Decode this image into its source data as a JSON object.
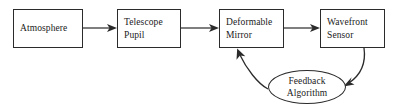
{
  "diagram": {
    "background_color": "#ffffff",
    "stroke_color": "#2b2b2b",
    "text_color": "#1a1a1a",
    "nodes": [
      {
        "id": "atmosphere",
        "shape": "rectangle",
        "lines": [
          "Atmosphere"
        ],
        "line1": "Atmosphere",
        "line2": ""
      },
      {
        "id": "telescope-pupil",
        "shape": "rectangle",
        "lines": [
          "Telescope",
          "Pupil"
        ],
        "line1": "Telescope",
        "line2": "Pupil"
      },
      {
        "id": "deformable-mirror",
        "shape": "rectangle",
        "lines": [
          "Deformable",
          "Mirror"
        ],
        "line1": "Deformable",
        "line2": "Mirror"
      },
      {
        "id": "wavefront-sensor",
        "shape": "rectangle",
        "lines": [
          "Wavefront",
          "Sensor"
        ],
        "line1": "Wavefront",
        "line2": "Sensor"
      },
      {
        "id": "feedback-algorithm",
        "shape": "ellipse",
        "lines": [
          "Feedback",
          "Algorithm"
        ],
        "line1": "Feedback",
        "line2": "Algorithm"
      }
    ],
    "connectors": [
      {
        "id": "atmosphere-to-telescope-pupil",
        "from": "atmosphere",
        "to": "telescope-pupil",
        "style": "straight",
        "direction": "right",
        "label": ""
      },
      {
        "id": "telescope-pupil-to-deformable-mirror",
        "from": "telescope-pupil",
        "to": "deformable-mirror",
        "style": "straight",
        "direction": "right",
        "label": ""
      },
      {
        "id": "deformable-mirror-to-wavefront-sensor",
        "from": "deformable-mirror",
        "to": "wavefront-sensor",
        "style": "straight",
        "direction": "right",
        "label": ""
      },
      {
        "id": "wavefront-sensor-to-feedback-algorithm",
        "from": "wavefront-sensor",
        "to": "feedback-algorithm",
        "style": "curved",
        "direction": "down-left",
        "label": ""
      },
      {
        "id": "feedback-algorithm-to-deformable-mirror",
        "from": "feedback-algorithm",
        "to": "deformable-mirror",
        "style": "curved",
        "direction": "up-left",
        "label": ""
      }
    ]
  }
}
